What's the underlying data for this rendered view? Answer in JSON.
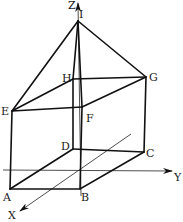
{
  "diagram": {
    "type": "3d-geometry",
    "axes": [
      {
        "name": "X",
        "label": "X"
      },
      {
        "name": "Y",
        "label": "Y"
      },
      {
        "name": "Z",
        "label": "Z"
      }
    ],
    "points": {
      "A": {
        "label": "A",
        "x": 10,
        "y": 189
      },
      "B": {
        "label": "B",
        "x": 80,
        "y": 189
      },
      "C": {
        "label": "C",
        "x": 144,
        "y": 152
      },
      "D": {
        "label": "D",
        "x": 73,
        "y": 149
      },
      "E": {
        "label": "E",
        "x": 12,
        "y": 111
      },
      "F": {
        "label": "F",
        "x": 82,
        "y": 107
      },
      "G": {
        "label": "G",
        "x": 146,
        "y": 77
      },
      "H": {
        "label": "H",
        "x": 73,
        "y": 79
      },
      "I": {
        "label": "I",
        "x": 78,
        "y": 21
      }
    },
    "edges": [
      [
        "A",
        "B"
      ],
      [
        "B",
        "C"
      ],
      [
        "C",
        "D"
      ],
      [
        "D",
        "A"
      ],
      [
        "E",
        "F"
      ],
      [
        "F",
        "G"
      ],
      [
        "G",
        "H"
      ],
      [
        "H",
        "E"
      ],
      [
        "A",
        "E"
      ],
      [
        "B",
        "F"
      ],
      [
        "C",
        "G"
      ],
      [
        "D",
        "H"
      ],
      [
        "I",
        "E"
      ],
      [
        "I",
        "F"
      ],
      [
        "I",
        "G"
      ],
      [
        "I",
        "H"
      ]
    ],
    "colors": {
      "stroke": "#111111",
      "background": "#ffffff"
    }
  }
}
